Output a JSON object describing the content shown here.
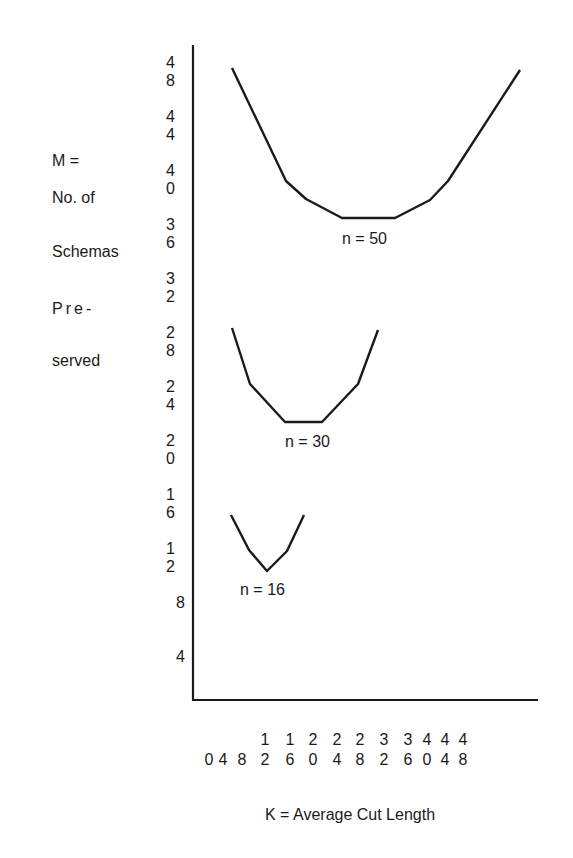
{
  "chart_data": {
    "type": "line",
    "title": "",
    "xlabel": "K = Average Cut Length",
    "ylabel_lines": [
      "M =",
      "No. of",
      "Schemas",
      "Pre-",
      "served"
    ],
    "ylabel": "M = No. of Schemas Preserved",
    "x_ticks": [
      "0",
      "4",
      "8",
      "12",
      "16",
      "20",
      "24",
      "28",
      "32",
      "36",
      "40",
      "44",
      "48"
    ],
    "y_ticks": [
      "48",
      "44",
      "40",
      "36",
      "32",
      "28",
      "24",
      "20",
      "16",
      "12",
      "8",
      "4"
    ],
    "xlim": [
      0,
      60
    ],
    "ylim": [
      0,
      49
    ],
    "grid": false,
    "legend": "inline labels under each curve",
    "series": [
      {
        "name": "n = 50",
        "x": [
          4.4,
          14.6,
          18.4,
          25.2,
          35.3,
          42.0,
          45.4,
          59.0
        ],
        "y": [
          47.6,
          39.3,
          38.0,
          36.5,
          36.5,
          37.9,
          39.3,
          47.5
        ],
        "px": [
          [
            232,
            68
          ],
          [
            286,
            181
          ],
          [
            306,
            199
          ],
          [
            342,
            218
          ],
          [
            395,
            218
          ],
          [
            430,
            200
          ],
          [
            448,
            181
          ],
          [
            520,
            70
          ]
        ]
      },
      {
        "name": "n = 30",
        "x": [
          4.4,
          7.8,
          14.4,
          21.4,
          28.3,
          32.1
        ],
        "y": [
          28.3,
          24.2,
          21.4,
          21.4,
          24.2,
          28.2
        ],
        "px": [
          [
            232,
            328
          ],
          [
            250,
            384
          ],
          [
            285,
            422
          ],
          [
            322,
            422
          ],
          [
            358,
            384
          ],
          [
            378,
            330
          ]
        ]
      },
      {
        "name": "n = 16",
        "x": [
          4.2,
          7.6,
          11.0,
          14.8,
          18.0
        ],
        "y": [
          14.4,
          11.8,
          10.3,
          11.8,
          14.4
        ],
        "px": [
          [
            231,
            515
          ],
          [
            249,
            550
          ],
          [
            267,
            571
          ],
          [
            287,
            551
          ],
          [
            304,
            515
          ]
        ]
      }
    ]
  },
  "labels": {
    "ylabel_lines": [
      "M =",
      "No. of",
      "Schemas",
      "Pre-",
      "served"
    ],
    "y_ticks": [
      "4 8",
      "4 4",
      "4 0",
      "3 6",
      "3 2",
      "2 8",
      "2 4",
      "2 0",
      "1 6",
      "1 2",
      "8",
      "4"
    ],
    "x_ticks_top": [
      "",
      "",
      "",
      "1",
      "1",
      "2",
      "2",
      "2",
      "3",
      "3",
      "4",
      "4",
      "4"
    ],
    "x_ticks_bottom": [
      "0",
      "4",
      "8",
      "2",
      "6",
      "0",
      "4",
      "8",
      "2",
      "6",
      "0",
      "4",
      "8"
    ],
    "series_labels": [
      "n = 50",
      "n = 30",
      "n = 16"
    ],
    "xlabel": "K = Average Cut Length"
  }
}
